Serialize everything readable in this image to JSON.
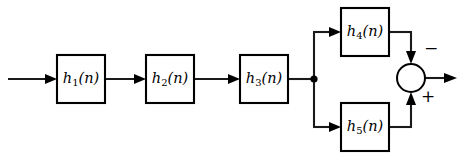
{
  "diagram": {
    "line_color": "#1a1a1a",
    "block_fill": "#ffffff",
    "blocks": [
      {
        "id": "h1",
        "fn": "h",
        "sub": "1",
        "arg": "(n)",
        "label": "h₁(n)",
        "x": 57,
        "y": 55,
        "w": 48,
        "h": 48
      },
      {
        "id": "h2",
        "fn": "h",
        "sub": "2",
        "arg": "(n)",
        "label": "h₂(n)",
        "x": 146,
        "y": 55,
        "w": 48,
        "h": 48
      },
      {
        "id": "h3",
        "fn": "h",
        "sub": "3",
        "arg": "(n)",
        "label": "h₃(n)",
        "x": 240,
        "y": 55,
        "w": 48,
        "h": 48
      },
      {
        "id": "h4",
        "fn": "h",
        "sub": "4",
        "arg": "(n)",
        "label": "h₄(n)",
        "x": 341,
        "y": 8,
        "w": 48,
        "h": 48
      },
      {
        "id": "h5",
        "fn": "h",
        "sub": "5",
        "arg": "(n)",
        "label": "h₅(n)",
        "x": 341,
        "y": 103,
        "w": 48,
        "h": 48
      }
    ],
    "summing_junction": {
      "id": "sum",
      "cx": 411,
      "cy": 78,
      "r": 14,
      "minus_sign": "−",
      "plus_sign": "+",
      "minus_pos": {
        "x": 424,
        "y": 40
      },
      "plus_pos": {
        "x": 421,
        "y": 88
      }
    },
    "node": {
      "id": "branch",
      "cx": 314,
      "cy": 79,
      "r": 3.6
    },
    "input": {
      "label": "",
      "x_start": 8,
      "y": 79
    },
    "output": {
      "label": "",
      "x_end": 457,
      "y": 78
    }
  }
}
